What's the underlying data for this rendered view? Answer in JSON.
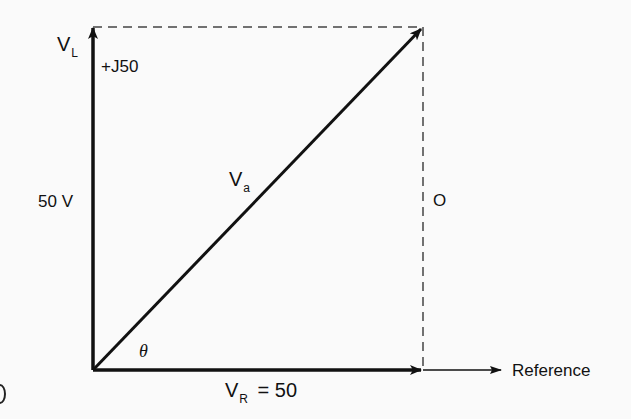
{
  "diagram": {
    "type": "phasor-diagram",
    "labels": {
      "vl_main": "V",
      "vl_sub": "L",
      "vl_value": "+J50",
      "vl_magnitude": "50 V",
      "va_main": "V",
      "va_sub": "a",
      "theta": "θ",
      "vr_main": "V",
      "vr_sub": "R",
      "vr_value": "= 50",
      "dashed_side_label": "O",
      "reference": "Reference"
    },
    "vectors": [
      {
        "name": "V_L",
        "direction": "vertical-up",
        "magnitude": 50,
        "unit": "V",
        "notation": "+J50"
      },
      {
        "name": "V_R",
        "direction": "horizontal-right",
        "magnitude": 50,
        "notation": "= 50"
      },
      {
        "name": "V_a",
        "direction": "diagonal",
        "components": [
          "V_R",
          "V_L"
        ]
      }
    ],
    "colors": {
      "line": "#111111",
      "dashed": "#444444",
      "background": "#fafafa"
    }
  }
}
